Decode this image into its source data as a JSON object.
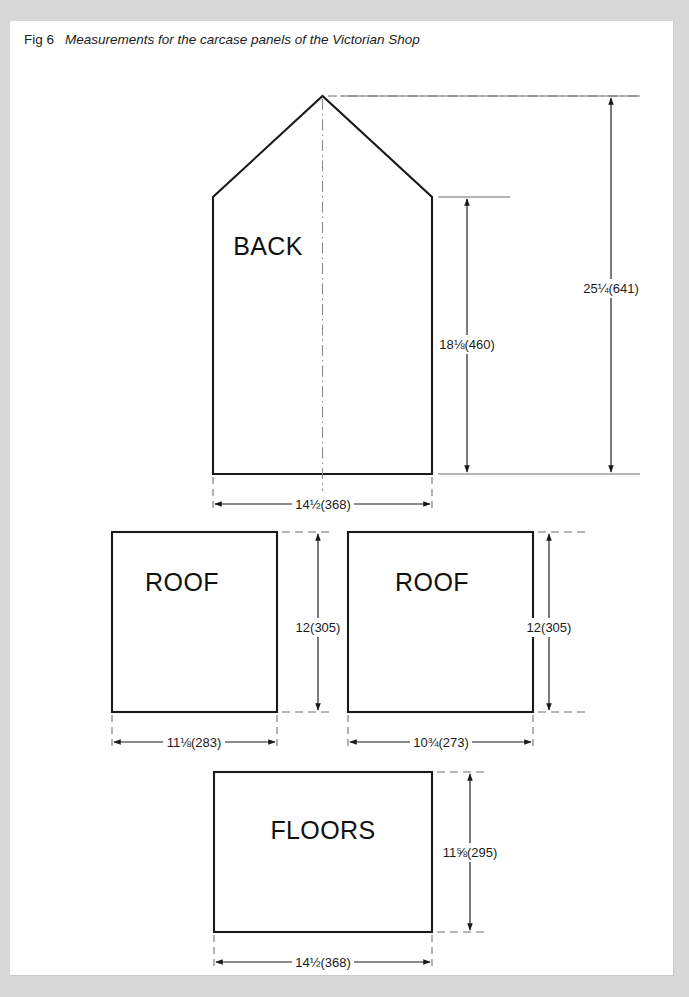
{
  "caption": {
    "fig_label": "Fig 6",
    "title": "Measurements for the carcase panels of the Victorian Shop"
  },
  "colors": {
    "page_background": "#d8d8d8",
    "sheet": "#ffffff",
    "outline": "#1a1a1a",
    "dimension": "#1a1a1a",
    "extension": "#6f6f6f",
    "centerline": "#8a8a8a",
    "text": "#1b1b1b"
  },
  "panels": [
    {
      "id": "back",
      "name": "BACK",
      "shape": "gable",
      "label_x": 268,
      "label_y": 234,
      "dimensions": {
        "overall_height": "25¼(641)",
        "wall_height": "18⅛(460)",
        "width": "14½(368)"
      }
    },
    {
      "id": "roof-left",
      "name": "ROOF",
      "shape": "rectangle",
      "label_x": 161,
      "label_y": 570,
      "dimensions": {
        "height": "12(305)",
        "width": "11⅛(283)"
      }
    },
    {
      "id": "roof-right",
      "name": "ROOF",
      "shape": "rectangle",
      "label_x": 412,
      "label_y": 570,
      "dimensions": {
        "height": "12(305)",
        "width": "10¾(273)"
      }
    },
    {
      "id": "floors",
      "name": "FLOORS",
      "shape": "rectangle",
      "label_x": 269,
      "label_y": 818,
      "dimensions": {
        "height": "11⅝(295)",
        "width": "14½(368)"
      }
    }
  ],
  "dimension_labels": {
    "back_overall_height": {
      "text": "25¼(641)",
      "x": 611,
      "y": 277,
      "anchor": "middle"
    },
    "back_wall_height": {
      "text": "18⅛(460)",
      "x": 467,
      "y": 333,
      "anchor": "middle"
    },
    "back_width": {
      "text": "14½(368)",
      "x": 323,
      "y": 498,
      "anchor": "middle"
    },
    "roof_left_height": {
      "text": "12(305)",
      "x": 318,
      "y": 616,
      "anchor": "middle"
    },
    "roof_left_width": {
      "text": "11⅛(283)",
      "x": 194,
      "y": 736,
      "anchor": "middle"
    },
    "roof_right_height": {
      "text": "12(305)",
      "x": 549,
      "y": 616,
      "anchor": "middle"
    },
    "roof_right_width": {
      "text": "10¾(273)",
      "x": 441,
      "y": 736,
      "anchor": "middle"
    },
    "floors_height": {
      "text": "11⅝(295)",
      "x": 470,
      "y": 850,
      "anchor": "middle"
    },
    "floors_width": {
      "text": "14½(368)",
      "x": 323,
      "y": 940,
      "anchor": "middle"
    }
  },
  "geometry": {
    "back": {
      "apex_x": 322.5,
      "apex_y": 85,
      "eave_y": 186,
      "left_x": 213,
      "right_x": 434,
      "bottom_y": 463
    },
    "roof_left": {
      "x1": 112,
      "y1": 521,
      "x2": 277,
      "y2": 701
    },
    "roof_right": {
      "x1": 348,
      "y1": 521,
      "x2": 533,
      "y2": 701
    },
    "floors": {
      "x1": 214,
      "y1": 761,
      "x2": 432,
      "y2": 921
    }
  }
}
